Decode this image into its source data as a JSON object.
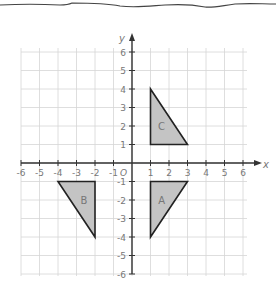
{
  "diagram": {
    "type": "coordinate-grid",
    "x_range": [
      -6,
      6
    ],
    "y_range": [
      -6,
      6
    ],
    "axis_labels": {
      "x": "x",
      "y": "y"
    },
    "origin_label": "O",
    "x_ticks": [
      {
        "value": -6,
        "label": "-6"
      },
      {
        "value": -5,
        "label": "-5"
      },
      {
        "value": -4,
        "label": "-4"
      },
      {
        "value": -3,
        "label": "-3"
      },
      {
        "value": -2,
        "label": "-2"
      },
      {
        "value": -1,
        "label": "-1"
      },
      {
        "value": 1,
        "label": "1"
      },
      {
        "value": 2,
        "label": "2"
      },
      {
        "value": 3,
        "label": "3"
      },
      {
        "value": 4,
        "label": "4"
      },
      {
        "value": 5,
        "label": "5"
      },
      {
        "value": 6,
        "label": "6"
      }
    ],
    "y_ticks": [
      {
        "value": 6,
        "label": "6"
      },
      {
        "value": 5,
        "label": "5"
      },
      {
        "value": 4,
        "label": "4"
      },
      {
        "value": 3,
        "label": "3"
      },
      {
        "value": 2,
        "label": "2"
      },
      {
        "value": 1,
        "label": "1"
      },
      {
        "value": -1,
        "label": "-1"
      },
      {
        "value": -2,
        "label": "-2"
      },
      {
        "value": -3,
        "label": "-3"
      },
      {
        "value": -4,
        "label": "-4"
      },
      {
        "value": -5,
        "label": "-5"
      },
      {
        "value": -6,
        "label": "-6"
      }
    ],
    "shapes": [
      {
        "label": "C",
        "vertices": [
          [
            1,
            4
          ],
          [
            1,
            1
          ],
          [
            3,
            1
          ]
        ],
        "label_pos": [
          1.6,
          2.0
        ]
      },
      {
        "label": "A",
        "vertices": [
          [
            1,
            -1
          ],
          [
            3,
            -1
          ],
          [
            1,
            -4
          ]
        ],
        "label_pos": [
          1.6,
          -2.0
        ]
      },
      {
        "label": "B",
        "vertices": [
          [
            -4,
            -1
          ],
          [
            -2,
            -1
          ],
          [
            -2,
            -4
          ]
        ],
        "label_pos": [
          -2.6,
          -2.0
        ]
      }
    ],
    "colors": {
      "grid": "#d6d6d6",
      "axis": "#333333",
      "shape_fill": "#c4c4c4",
      "shape_stroke": "#222222",
      "label_text": "#777777",
      "tear_line": "#444444"
    }
  }
}
